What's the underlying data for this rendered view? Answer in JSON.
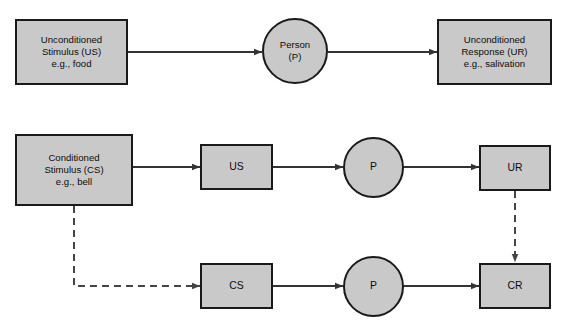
{
  "diagram": {
    "background_color": "#ffffff",
    "node_fill_color": "#c9c9c9",
    "node_border_color": "#1a1a1a",
    "connector_color": "#333333",
    "panels": [
      {
        "id": "panel-before-conditioning",
        "nodes": [
          {
            "id": "us-full",
            "shape": "rect",
            "lines": [
              "Unconditioned",
              "Stimulus (US)",
              "e.g., food"
            ]
          },
          {
            "id": "person-top",
            "shape": "circle",
            "lines": [
              "Person",
              "(P)"
            ]
          },
          {
            "id": "ur-full",
            "shape": "rect",
            "lines": [
              "Unconditioned",
              "Response (UR)",
              "e.g., salivation"
            ]
          }
        ],
        "connectors": [
          {
            "id": "us-to-person",
            "style": "solid",
            "arrow": true
          },
          {
            "id": "person-to-ur",
            "style": "solid",
            "arrow": true
          }
        ]
      },
      {
        "id": "panel-conditioning",
        "nodes": [
          {
            "id": "cs-full",
            "shape": "rect",
            "lines": [
              "Conditioned",
              "Stimulus (CS)",
              "e.g., bell"
            ]
          },
          {
            "id": "us-short",
            "shape": "rect",
            "lines": [
              "US"
            ]
          },
          {
            "id": "person-row2",
            "shape": "circle",
            "lines": [
              "P"
            ]
          },
          {
            "id": "ur-short",
            "shape": "rect",
            "lines": [
              "UR"
            ]
          },
          {
            "id": "cs-short",
            "shape": "rect",
            "lines": [
              "CS"
            ]
          },
          {
            "id": "person-row3",
            "shape": "circle",
            "lines": [
              "P"
            ]
          },
          {
            "id": "cr-short",
            "shape": "rect",
            "lines": [
              "CR"
            ]
          }
        ],
        "connectors": [
          {
            "id": "csfull-to-us",
            "style": "solid",
            "arrow": true
          },
          {
            "id": "us-to-person2",
            "style": "solid",
            "arrow": true
          },
          {
            "id": "person2-to-ur",
            "style": "solid",
            "arrow": true
          },
          {
            "id": "csfull-to-cs",
            "style": "dashed",
            "arrow": true
          },
          {
            "id": "cs-to-person3",
            "style": "solid",
            "arrow": true
          },
          {
            "id": "person3-to-cr",
            "style": "solid",
            "arrow": true
          },
          {
            "id": "ur-to-cr",
            "style": "dashed",
            "arrow": true
          }
        ]
      }
    ]
  }
}
